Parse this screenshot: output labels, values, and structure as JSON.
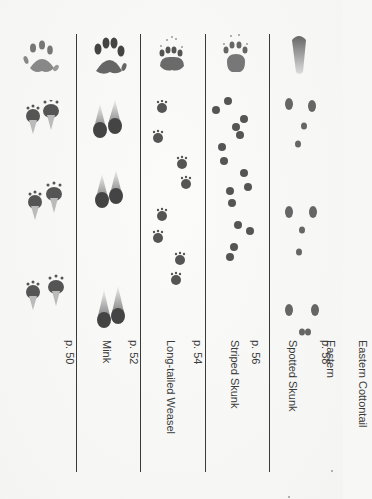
{
  "page": {
    "orientation": "rotated-90-clockwise",
    "columns": [
      {
        "name": "Mink",
        "page": "p. 50",
        "label_lines": [
          "Mink",
          "p. 50"
        ],
        "track_style": "mink"
      },
      {
        "name": "Long-tailed Weasel",
        "page": "p. 52",
        "label_lines": [
          "Long-tailed Weasel",
          "p. 52"
        ],
        "track_style": "weasel"
      },
      {
        "name": "Striped Skunk",
        "page": "p. 54",
        "label_lines": [
          "Striped Skunk",
          "p. 54"
        ],
        "track_style": "striped-skunk"
      },
      {
        "name": "Eastern Spotted Skunk",
        "page": "p. 56",
        "label_lines": [
          "Eastern",
          "Spotted Skunk",
          "p. 56"
        ],
        "track_style": "spotted-skunk"
      },
      {
        "name": "Eastern Cottontail",
        "page": "p. 58",
        "label_lines": [
          "Eastern Cottontail",
          "p. 58"
        ],
        "track_style": "cottontail"
      }
    ],
    "colors": {
      "ink": "#3b3b3b",
      "print": "#4a4a4a",
      "background": "#f7f7f5"
    }
  }
}
